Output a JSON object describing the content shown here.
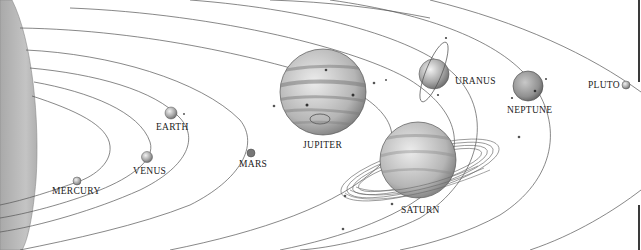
{
  "diagram": {
    "colors": {
      "background": "#ffffff",
      "orbit_line": "#555555",
      "sun": "#b8b8b8",
      "label": "#222222"
    },
    "sun": {
      "name": "sun"
    },
    "planets": [
      {
        "key": "mercury",
        "label": "MERCURY"
      },
      {
        "key": "venus",
        "label": "VENUS"
      },
      {
        "key": "earth",
        "label": "EARTH"
      },
      {
        "key": "mars",
        "label": "MARS"
      },
      {
        "key": "jupiter",
        "label": "JUPITER"
      },
      {
        "key": "saturn",
        "label": "SATURN"
      },
      {
        "key": "uranus",
        "label": "URANUS"
      },
      {
        "key": "neptune",
        "label": "NEPTUNE"
      },
      {
        "key": "pluto",
        "label": "PLUTO"
      }
    ]
  }
}
